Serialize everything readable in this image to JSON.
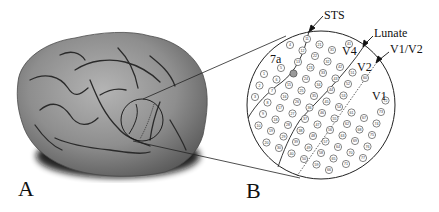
{
  "panels": {
    "a": {
      "label": "A"
    },
    "b": {
      "label": "B"
    }
  },
  "annotations": {
    "sts": "STS",
    "lunate": "Lunate",
    "v1v2": "V1/V2"
  },
  "areas": {
    "a7a": "7a",
    "v4": "V4",
    "v2": "V2",
    "v1": "V1"
  },
  "colors": {
    "brain": "#8a8a8a",
    "sulcus": "#2a2a2a",
    "shadow": "#1a1a1a",
    "electrode_fill": "#ffffff",
    "electrode_highlight": "#9a9a9a",
    "line": "#222222"
  }
}
